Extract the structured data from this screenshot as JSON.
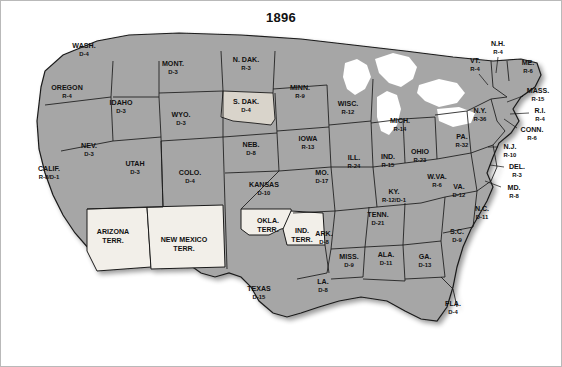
{
  "title": "1896",
  "colors": {
    "state_fill": "#a6a6a6",
    "state_fill_light": "#d9d4cb",
    "territory_fill": "#f2efe9",
    "water": "#ffffff",
    "outline": "#1a1a1a",
    "label_text": "#111111",
    "frame": "#b9b9b9"
  },
  "legend_note": "State labels show party initial and electoral votes",
  "states": [
    {
      "name": "WASH.",
      "ev": "D-4",
      "x": 83,
      "y": 47,
      "fill": "state_fill"
    },
    {
      "name": "OREGON",
      "ev": "R-4",
      "x": 66,
      "y": 89,
      "fill": "state_fill"
    },
    {
      "name": "IDAHO",
      "ev": "D-3",
      "x": 120,
      "y": 104,
      "fill": "state_fill"
    },
    {
      "name": "MONT.",
      "ev": "D-3",
      "x": 172,
      "y": 65,
      "fill": "state_fill"
    },
    {
      "name": "N. DAK.",
      "ev": "R-3",
      "x": 245,
      "y": 61,
      "fill": "state_fill"
    },
    {
      "name": "S. DAK.",
      "ev": "D-4",
      "x": 245,
      "y": 103,
      "fill": "state_fill_light"
    },
    {
      "name": "MINN.",
      "ev": "R-9",
      "x": 299,
      "y": 89,
      "fill": "state_fill"
    },
    {
      "name": "WISC.",
      "ev": "R-12",
      "x": 347,
      "y": 105,
      "fill": "state_fill"
    },
    {
      "name": "MICH.",
      "ev": "R-14",
      "x": 399,
      "y": 122,
      "fill": "state_fill"
    },
    {
      "name": "WYO.",
      "ev": "D-3",
      "x": 180,
      "y": 116,
      "fill": "state_fill"
    },
    {
      "name": "NEV.",
      "ev": "D-3",
      "x": 88,
      "y": 147,
      "fill": "state_fill"
    },
    {
      "name": "UTAH",
      "ev": "D-3",
      "x": 134,
      "y": 165,
      "fill": "state_fill"
    },
    {
      "name": "COLO.",
      "ev": "D-4",
      "x": 189,
      "y": 174,
      "fill": "state_fill"
    },
    {
      "name": "NEB.",
      "ev": "D-8",
      "x": 250,
      "y": 146,
      "fill": "state_fill"
    },
    {
      "name": "IOWA",
      "ev": "R-13",
      "x": 307,
      "y": 140,
      "fill": "state_fill"
    },
    {
      "name": "ILL.",
      "ev": "R-24",
      "x": 353,
      "y": 159,
      "fill": "state_fill"
    },
    {
      "name": "IND.",
      "ev": "R-15",
      "x": 387,
      "y": 158,
      "fill": "state_fill"
    },
    {
      "name": "OHIO",
      "ev": "R-23",
      "x": 419,
      "y": 153,
      "fill": "state_fill"
    },
    {
      "name": "CALIF.",
      "ev": "R-8/D-1",
      "x": 48,
      "y": 170,
      "fill": "state_fill"
    },
    {
      "name": "KANSAS",
      "ev": "D-10",
      "x": 263,
      "y": 186,
      "fill": "state_fill"
    },
    {
      "name": "MO.",
      "ev": "D-17",
      "x": 321,
      "y": 174,
      "fill": "state_fill"
    },
    {
      "name": "KY.",
      "ev": "R-12/D-1",
      "x": 393,
      "y": 193,
      "fill": "state_fill"
    },
    {
      "name": "W.VA.",
      "ev": "R-6",
      "x": 436,
      "y": 178,
      "fill": "state_fill"
    },
    {
      "name": "VA.",
      "ev": "D-12",
      "x": 458,
      "y": 188,
      "fill": "state_fill"
    },
    {
      "name": "TENN.",
      "ev": "D-21",
      "x": 377,
      "y": 216,
      "fill": "state_fill"
    },
    {
      "name": "N.C.",
      "ev": "D-11",
      "x": 481,
      "y": 210,
      "fill": "state_fill"
    },
    {
      "name": "ARK.",
      "ev": "D-8",
      "x": 323,
      "y": 235,
      "fill": "state_fill"
    },
    {
      "name": "S.C.",
      "ev": "D-9",
      "x": 456,
      "y": 233,
      "fill": "state_fill"
    },
    {
      "name": "MISS.",
      "ev": "D-9",
      "x": 348,
      "y": 258,
      "fill": "state_fill"
    },
    {
      "name": "ALA.",
      "ev": "D-11",
      "x": 385,
      "y": 256,
      "fill": "state_fill"
    },
    {
      "name": "GA.",
      "ev": "D-13",
      "x": 424,
      "y": 258,
      "fill": "state_fill"
    },
    {
      "name": "LA.",
      "ev": "D-8",
      "x": 322,
      "y": 283,
      "fill": "state_fill"
    },
    {
      "name": "TEXAS",
      "ev": "D-15",
      "x": 258,
      "y": 290,
      "fill": "state_fill"
    },
    {
      "name": "FLA.",
      "ev": "D-4",
      "x": 452,
      "y": 305,
      "fill": "state_fill"
    },
    {
      "name": "PA.",
      "ev": "R-32",
      "x": 461,
      "y": 138,
      "fill": "state_fill"
    },
    {
      "name": "N.Y.",
      "ev": "R-36",
      "x": 479,
      "y": 112,
      "fill": "state_fill"
    },
    {
      "name": "ME.",
      "ev": "R-6",
      "x": 527,
      "y": 64,
      "fill": "state_fill"
    }
  ],
  "callout_states": [
    {
      "name": "N.H.",
      "ev": "R-4",
      "x": 497,
      "y": 45,
      "lx1": 497,
      "ly1": 56,
      "lx2": 495,
      "ly2": 72
    },
    {
      "name": "VT.",
      "ev": "R-4",
      "x": 474,
      "y": 62,
      "lx1": 478,
      "ly1": 73,
      "lx2": 487,
      "ly2": 84
    },
    {
      "name": "MASS.",
      "ev": "R-15",
      "x": 537,
      "y": 92,
      "lx1": 522,
      "ly1": 95,
      "lx2": 506,
      "ly2": 101
    },
    {
      "name": "R.I.",
      "ev": "R-4",
      "x": 539,
      "y": 112,
      "lx1": 528,
      "ly1": 112,
      "lx2": 509,
      "ly2": 113
    },
    {
      "name": "CONN.",
      "ev": "R-6",
      "x": 531,
      "y": 131,
      "lx1": 516,
      "ly1": 127,
      "lx2": 503,
      "ly2": 118
    },
    {
      "name": "N.J.",
      "ev": "R-10",
      "x": 509,
      "y": 148,
      "lx1": 497,
      "ly1": 146,
      "lx2": 487,
      "ly2": 146
    },
    {
      "name": "DEL.",
      "ev": "R-3",
      "x": 516,
      "y": 168,
      "lx1": 503,
      "ly1": 166,
      "lx2": 489,
      "ly2": 164
    },
    {
      "name": "MD.",
      "ev": "R-8",
      "x": 513,
      "y": 189,
      "lx1": 500,
      "ly1": 186,
      "lx2": 484,
      "ly2": 180
    }
  ],
  "territories": [
    {
      "name": "ARIZONA TERR.",
      "line1": "ARIZONA",
      "line2": "TERR.",
      "x": 112,
      "y": 233
    },
    {
      "name": "NEW MEXICO TERR.",
      "line1": "NEW MEXICO",
      "line2": "TERR.",
      "x": 183,
      "y": 241
    },
    {
      "name": "OKLA. TERR.",
      "line1": "OKLA.",
      "line2": "TERR.",
      "x": 267,
      "y": 222
    },
    {
      "name": "IND. TERR.",
      "line1": "IND.",
      "line2": "TERR.",
      "x": 301,
      "y": 232
    }
  ]
}
